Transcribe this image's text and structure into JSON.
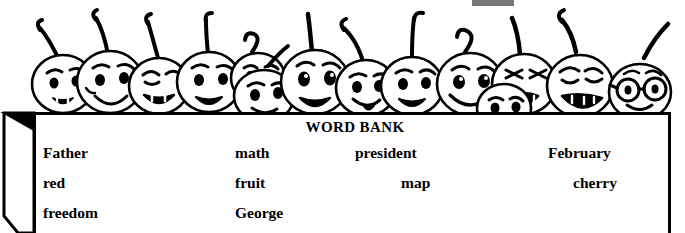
{
  "worksheet": {
    "decoration": {
      "name": "cherry-characters-row",
      "description": "row of smiling cartoon cherry faces with stems sitting on top of the word bank box",
      "count": 13,
      "ink_color": "#000000",
      "fill_color": "#ffffff"
    },
    "top_artifact": {
      "name": "scan-artifact-mark",
      "color": "#555555"
    },
    "word_bank": {
      "title": "WORD BANK",
      "border_color": "#000000",
      "background_color": "#ffffff",
      "rows": [
        [
          {
            "text": "Father",
            "x": 7
          },
          {
            "text": "math",
            "x": 199
          },
          {
            "text": "president",
            "x": 319
          },
          {
            "text": "February",
            "x": 512
          }
        ],
        [
          {
            "text": "red",
            "x": 7
          },
          {
            "text": "fruit",
            "x": 199
          },
          {
            "text": "map",
            "x": 365
          },
          {
            "text": "cherry",
            "x": 537
          }
        ],
        [
          {
            "text": "freedom",
            "x": 7
          },
          {
            "text": "George",
            "x": 199
          }
        ]
      ]
    }
  }
}
